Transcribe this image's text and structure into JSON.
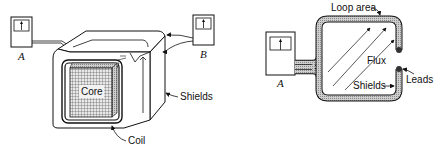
{
  "figure": {
    "left_panel": {
      "meter_a_label": "A",
      "meter_b_label": "B",
      "core_label": "Core",
      "shields_label": "Shields",
      "coil_label": "Coil"
    },
    "right_panel": {
      "meter_a_label": "A",
      "loop_area_label": "Loop area",
      "flux_label": "Flux",
      "shields_label": "Shields",
      "leads_label": "Leads"
    }
  },
  "colors": {
    "line": "#111111",
    "shield_fill": "#bdbdbd",
    "core_grid": "#555555",
    "background": "#ffffff"
  }
}
